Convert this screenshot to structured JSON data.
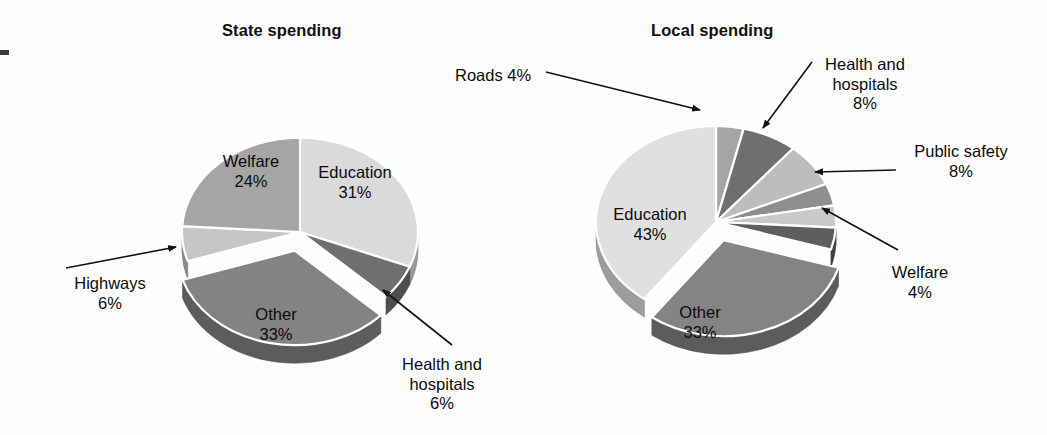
{
  "figure": {
    "background_color": "#fdfdfd",
    "text_color": "#0c0c0c"
  },
  "charts": {
    "state": {
      "title": "State spending",
      "labels": {
        "welfare": "Welfare\n24%",
        "education": "Education\n31%",
        "highways": "Highways\n6%",
        "other": "Other\n33%",
        "health": "Health and\nhospitals\n6%"
      }
    },
    "local": {
      "title": "Local spending",
      "labels": {
        "roads": "Roads 4%",
        "health": "Health and\nhospitals\n8%",
        "publicsafety": "Public safety\n8%",
        "welfare": "Welfare\n4%",
        "education": "Education\n43%",
        "other": "Other\n33%"
      }
    }
  },
  "chart_data": [
    {
      "type": "pie",
      "title": "State spending",
      "id": "state-spending",
      "unit": "percent",
      "center": [
        300,
        232
      ],
      "radius": 118,
      "depth": 18,
      "start_angle_deg": 0,
      "direction": "clockwise",
      "categories": [
        "Education",
        "Health and hospitals",
        "Other",
        "Highways",
        "Welfare"
      ],
      "values": [
        31,
        6,
        33,
        6,
        24
      ],
      "labels": [
        "Education 31%",
        "Health and hospitals 6%",
        "Other 33%",
        "Highways 6%",
        "Welfare 24%"
      ],
      "colors": [
        "#dadada",
        "#6f6f6f",
        "#838383",
        "#c6c6c6",
        "#a5a5a5"
      ],
      "exploded": [
        "Other"
      ],
      "legend": "none",
      "grid": false,
      "xlabel": "",
      "ylabel": ""
    },
    {
      "type": "pie",
      "title": "Local spending",
      "id": "local-spending",
      "unit": "percent",
      "center": [
        716,
        222
      ],
      "radius": 120,
      "depth": 18,
      "start_angle_deg": 0,
      "direction": "clockwise",
      "categories": [
        "Roads",
        "Health and hospitals",
        "Public safety",
        "Other services",
        "Utilities",
        "Welfare",
        "Other",
        "Education"
      ],
      "values": [
        4,
        8,
        8,
        4,
        4,
        4,
        33,
        43
      ],
      "labels": [
        "Roads 4%",
        "Health and hospitals 8%",
        "Public safety 8%",
        "",
        "",
        "Welfare 4%",
        "Other 33%",
        "Education 43%"
      ],
      "colors": [
        "#a5a5a5",
        "#6f6f6f",
        "#bdbdbd",
        "#8e8e8e",
        "#c9c9c9",
        "#5e5e5e",
        "#848484",
        "#e0e0e0"
      ],
      "exploded": [
        "Other"
      ],
      "legend": "none",
      "grid": false,
      "xlabel": "",
      "ylabel": ""
    }
  ]
}
